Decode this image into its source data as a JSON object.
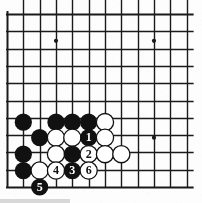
{
  "board": {
    "title": "Go board diagram",
    "background_color": "#fdfdfd",
    "line_color": "#1a1a1a",
    "black_stone_color": "#111111",
    "white_stone_color": "#ffffff",
    "white_stone_border_color": "#111111",
    "geometry": {
      "left": 7,
      "top": 14,
      "col_spacing": 16.33,
      "row_spacing": 17.3,
      "cols": 12,
      "rows": 11,
      "stone_radius": 8.6,
      "line_width": 1.4,
      "edge_line_width": 2.0
    },
    "star_points": [
      {
        "col": 3,
        "row": 1.55
      },
      {
        "col": 9,
        "row": 1.55
      },
      {
        "col": 9,
        "row": 7.15
      }
    ],
    "stones": [
      {
        "col": 1,
        "row": 6.25,
        "color": "black",
        "label": ""
      },
      {
        "col": 3,
        "row": 6.25,
        "color": "black",
        "label": ""
      },
      {
        "col": 4,
        "row": 6.25,
        "color": "black",
        "label": ""
      },
      {
        "col": 5,
        "row": 6.25,
        "color": "black",
        "label": ""
      },
      {
        "col": 6,
        "row": 6.25,
        "color": "white",
        "label": ""
      },
      {
        "col": 2,
        "row": 7.15,
        "color": "black",
        "label": ""
      },
      {
        "col": 3,
        "row": 7.15,
        "color": "white",
        "label": ""
      },
      {
        "col": 4,
        "row": 7.15,
        "color": "white",
        "label": ""
      },
      {
        "col": 5,
        "row": 7.15,
        "color": "black",
        "label": "1"
      },
      {
        "col": 6,
        "row": 7.15,
        "color": "white",
        "label": ""
      },
      {
        "col": 1,
        "row": 8.1,
        "color": "black",
        "label": ""
      },
      {
        "col": 3,
        "row": 8.1,
        "color": "white",
        "label": ""
      },
      {
        "col": 4,
        "row": 8.1,
        "color": "black",
        "label": ""
      },
      {
        "col": 5,
        "row": 8.1,
        "color": "white",
        "label": "2"
      },
      {
        "col": 6,
        "row": 8.1,
        "color": "white",
        "label": ""
      },
      {
        "col": 7,
        "row": 8.1,
        "color": "white",
        "label": ""
      },
      {
        "col": 1,
        "row": 9.05,
        "color": "black",
        "label": ""
      },
      {
        "col": 2,
        "row": 9.05,
        "color": "white",
        "label": ""
      },
      {
        "col": 3,
        "row": 9.05,
        "color": "white",
        "label": "4"
      },
      {
        "col": 4,
        "row": 9.05,
        "color": "black",
        "label": "3"
      },
      {
        "col": 5,
        "row": 9.05,
        "color": "white",
        "label": "6"
      },
      {
        "col": 2,
        "row": 10.0,
        "color": "black",
        "label": "5"
      }
    ],
    "move_labels": [
      "1",
      "2",
      "3",
      "4",
      "5",
      "6"
    ]
  }
}
